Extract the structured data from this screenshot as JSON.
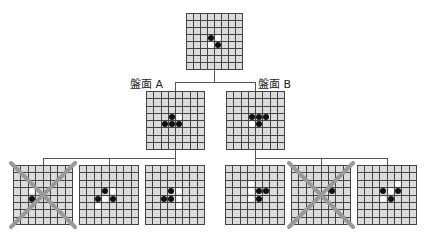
{
  "labels": {
    "a": "盤面 A",
    "b": "盤面 B"
  },
  "colors": {
    "grid": "#444444",
    "cell": "#dcdcdc",
    "black": "#111111",
    "white": "#ffffff",
    "cross": "#999999",
    "line": "#555555"
  },
  "boards": [
    {
      "id": "root",
      "x": 186,
      "y": 13,
      "size": 57,
      "crossed": false,
      "stones": [
        [
          3,
          3,
          "b"
        ],
        [
          3,
          4,
          "w"
        ],
        [
          4,
          3,
          "w"
        ],
        [
          4,
          4,
          "b"
        ]
      ]
    },
    {
      "id": "A",
      "x": 146,
      "y": 91,
      "size": 59,
      "crossed": false,
      "stones": [
        [
          3,
          3,
          "b"
        ],
        [
          3,
          4,
          "w"
        ],
        [
          4,
          2,
          "b"
        ],
        [
          4,
          3,
          "b"
        ],
        [
          4,
          4,
          "b"
        ]
      ]
    },
    {
      "id": "B",
      "x": 226,
      "y": 91,
      "size": 59,
      "crossed": false,
      "stones": [
        [
          3,
          3,
          "b"
        ],
        [
          3,
          4,
          "b"
        ],
        [
          3,
          5,
          "b"
        ],
        [
          4,
          3,
          "w"
        ],
        [
          4,
          4,
          "b"
        ]
      ]
    },
    {
      "id": "A1",
      "x": 13,
      "y": 165,
      "size": 60,
      "crossed": true,
      "stones": [
        [
          3,
          2,
          "w"
        ],
        [
          4,
          2,
          "b"
        ]
      ]
    },
    {
      "id": "A2",
      "x": 79,
      "y": 165,
      "size": 60,
      "crossed": false,
      "stones": [
        [
          3,
          3,
          "b"
        ],
        [
          3,
          4,
          "w"
        ],
        [
          4,
          2,
          "b"
        ],
        [
          4,
          3,
          "w"
        ],
        [
          4,
          4,
          "b"
        ],
        [
          5,
          2,
          "w"
        ]
      ]
    },
    {
      "id": "A3",
      "x": 145,
      "y": 165,
      "size": 60,
      "crossed": false,
      "stones": [
        [
          3,
          3,
          "b"
        ],
        [
          3,
          4,
          "w"
        ],
        [
          4,
          2,
          "b"
        ],
        [
          4,
          3,
          "b"
        ],
        [
          4,
          4,
          "w"
        ],
        [
          5,
          4,
          "w"
        ]
      ]
    },
    {
      "id": "B1",
      "x": 225,
      "y": 165,
      "size": 60,
      "crossed": false,
      "stones": [
        [
          2,
          3,
          "w"
        ],
        [
          3,
          3,
          "w"
        ],
        [
          3,
          4,
          "b"
        ],
        [
          3,
          5,
          "b"
        ],
        [
          4,
          3,
          "w"
        ],
        [
          4,
          4,
          "b"
        ]
      ]
    },
    {
      "id": "B2",
      "x": 291,
      "y": 165,
      "size": 60,
      "crossed": true,
      "stones": [
        [
          3,
          4,
          "w"
        ],
        [
          3,
          5,
          "b"
        ]
      ]
    },
    {
      "id": "B3",
      "x": 357,
      "y": 165,
      "size": 60,
      "crossed": false,
      "stones": [
        [
          2,
          5,
          "w"
        ],
        [
          3,
          3,
          "b"
        ],
        [
          3,
          4,
          "w"
        ],
        [
          3,
          5,
          "b"
        ],
        [
          4,
          3,
          "w"
        ],
        [
          4,
          4,
          "b"
        ]
      ]
    }
  ]
}
